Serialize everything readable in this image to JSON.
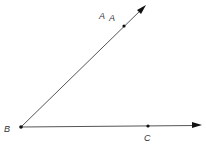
{
  "diagram": {
    "type": "angle",
    "vertex": {
      "label": "B",
      "x": 21,
      "y": 127
    },
    "rays": [
      {
        "name": "BA",
        "from": "B",
        "through": "A",
        "direction": "up-right"
      },
      {
        "name": "BC",
        "from": "B",
        "through": "C",
        "direction": "right"
      }
    ],
    "points": [
      {
        "label": "A",
        "x": 124,
        "y": 26
      },
      {
        "label": "B",
        "x": 21,
        "y": 127
      },
      {
        "label": "C",
        "x": 148,
        "y": 126
      }
    ],
    "labels": {
      "a_duplicate": "A",
      "a": "A",
      "b": "B",
      "c": "C"
    },
    "colors": {
      "line": "#555555",
      "point": "#111111",
      "text": "#333333"
    }
  }
}
